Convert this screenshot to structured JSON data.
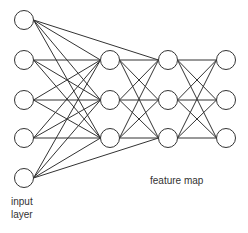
{
  "labels": {
    "input_line1": "input",
    "input_line2": "layer",
    "feature_map": "feature map"
  },
  "colors": {
    "stroke": "#333333",
    "node_fill": "#ffffff",
    "background": "#ffffff"
  },
  "layers": [
    {
      "name": "input",
      "x": 24,
      "ys": [
        20,
        60,
        100,
        138,
        178
      ]
    },
    {
      "name": "hidden1",
      "x": 110,
      "ys": [
        60,
        100,
        138
      ]
    },
    {
      "name": "hidden2",
      "x": 168,
      "ys": [
        60,
        100,
        138
      ]
    },
    {
      "name": "output",
      "x": 226,
      "ys": [
        60,
        100,
        138
      ]
    }
  ],
  "node_radius": 9.5,
  "extra_edges": [
    {
      "from": [
        0,
        0
      ],
      "to": [
        2,
        0
      ]
    },
    {
      "from": [
        0,
        4
      ],
      "to": [
        2,
        2
      ]
    }
  ]
}
